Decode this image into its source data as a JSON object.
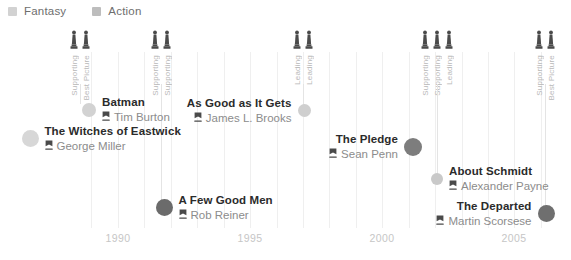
{
  "legend": {
    "items": [
      {
        "label": "Fantasy",
        "color": "#d2d2d2"
      },
      {
        "label": "Action",
        "color": "#bdbdbd"
      }
    ]
  },
  "axis": {
    "ticks": [
      {
        "label": "1990",
        "x": 118
      },
      {
        "label": "1995",
        "x": 250
      },
      {
        "label": "2000",
        "x": 382
      },
      {
        "label": "2005",
        "x": 514
      }
    ],
    "gridlines_x": [
      91,
      118,
      144,
      171,
      197,
      224,
      250,
      277,
      303,
      329,
      356,
      382,
      409,
      435,
      462,
      488,
      514,
      541
    ],
    "tick_y": 232,
    "grid_top": 52,
    "grid_bottom": 228
  },
  "award_icon_color": "#4a4a4a",
  "award_groups": [
    {
      "x": 80,
      "stem_bottom": 104,
      "awards": [
        {
          "label": "Supporting",
          "icon": "oscar-statuette-icon"
        },
        {
          "label": "Best Picture",
          "icon": "oscar-statuette-icon"
        }
      ]
    },
    {
      "x": 161,
      "stem_bottom": 206,
      "awards": [
        {
          "label": "Supporting",
          "icon": "oscar-statuette-icon"
        },
        {
          "label": "Supporting",
          "icon": "oscar-statuette-icon"
        }
      ]
    },
    {
      "x": 303,
      "stem_bottom": 110,
      "awards": [
        {
          "label": "Leading",
          "icon": "oscar-statuette-icon"
        },
        {
          "label": "Leading",
          "icon": "oscar-statuette-icon"
        }
      ]
    },
    {
      "x": 437,
      "stem_bottom": 177,
      "awards": [
        {
          "label": "Supporting",
          "icon": "oscar-statuette-icon"
        },
        {
          "label": "Supporting",
          "icon": "oscar-statuette-icon"
        },
        {
          "label": "Leading",
          "icon": "oscar-statuette-icon"
        }
      ]
    },
    {
      "x": 545,
      "stem_bottom": 215,
      "awards": [
        {
          "label": "Supporting",
          "icon": "oscar-statuette-icon"
        },
        {
          "label": "Best Picture",
          "icon": "oscar-statuette-icon"
        }
      ]
    }
  ],
  "films": [
    {
      "title": "Batman",
      "director": "Tim Burton",
      "side": "left",
      "dot_x": 89,
      "dot_y": 111,
      "dot_size": 14,
      "dot_color": "#d2d2d2",
      "genre": "Fantasy"
    },
    {
      "title": "The Witches of Eastwick",
      "director": "George Miller",
      "side": "left",
      "dot_x": 30,
      "dot_y": 140,
      "dot_size": 17,
      "dot_color": "#d7d7d7",
      "genre": "Fantasy"
    },
    {
      "title": "As Good as It Gets",
      "director": "James L. Brooks",
      "side": "right",
      "dot_x": 304,
      "dot_y": 112,
      "dot_size": 13,
      "dot_color": "#cfcfcf",
      "genre": "Fantasy"
    },
    {
      "title": "A Few Good Men",
      "director": "Rob Reiner",
      "side": "left",
      "dot_x": 164,
      "dot_y": 209,
      "dot_size": 17,
      "dot_color": "#6b6b6b",
      "genre": "Action"
    },
    {
      "title": "The Pledge",
      "director": "Sean Penn",
      "side": "right",
      "dot_x": 413,
      "dot_y": 148,
      "dot_size": 18,
      "dot_color": "#7d7d7d",
      "genre": "Action"
    },
    {
      "title": "About Schmidt",
      "director": "Alexander Payne",
      "side": "left",
      "dot_x": 437,
      "dot_y": 180,
      "dot_size": 12,
      "dot_color": "#c9c9c9",
      "genre": "Fantasy"
    },
    {
      "title": "The Departed",
      "director": "Martin Scorsese",
      "side": "right",
      "dot_x": 546,
      "dot_y": 215,
      "dot_size": 17,
      "dot_color": "#6f6f6f",
      "genre": "Action"
    }
  ]
}
